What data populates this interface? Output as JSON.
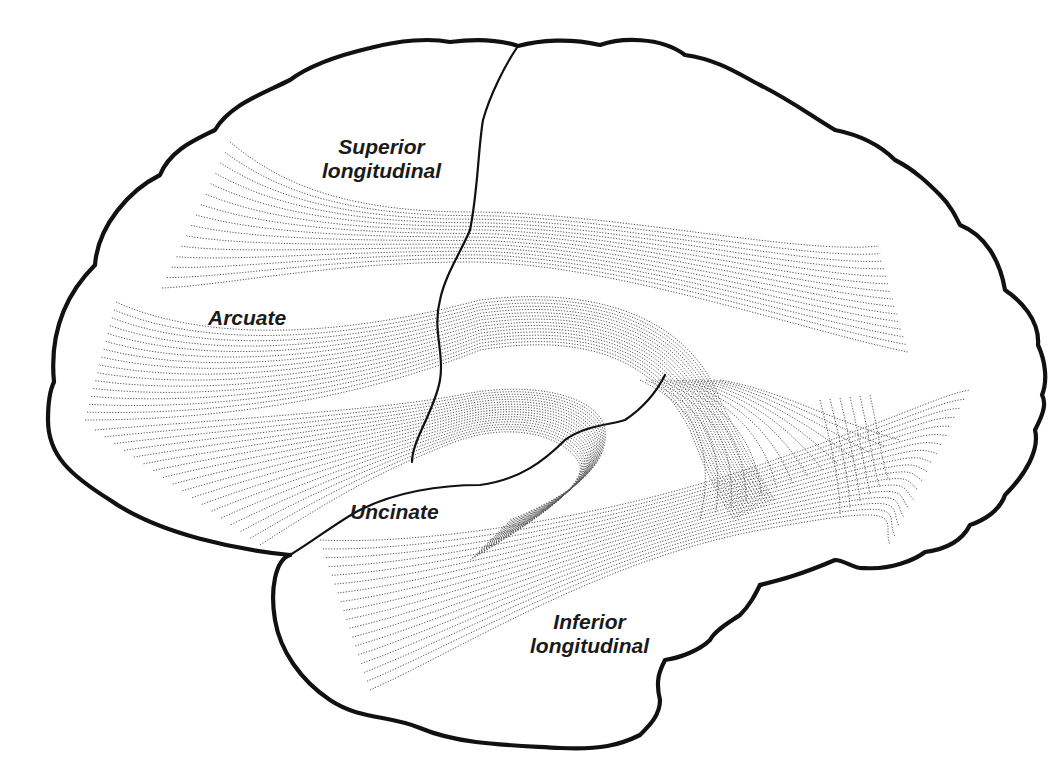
{
  "figure": {
    "labels": {
      "superior_longitudinal": {
        "line1": "Superior",
        "line2": "longitudinal"
      },
      "arcuate": {
        "line1": "Arcuate"
      },
      "uncinate": {
        "line1": "Uncinate"
      },
      "inferior_longitudinal": {
        "line1": "Inferior",
        "line2": "longitudinal"
      }
    },
    "colors": {
      "outline": "#111111",
      "fibers": "#555555",
      "label_text": "#1a1a1a",
      "background": "#ffffff"
    }
  }
}
